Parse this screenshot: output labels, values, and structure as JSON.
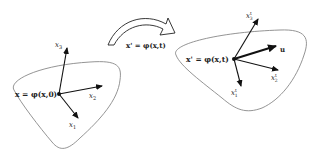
{
  "diagram": {
    "reference_config": {
      "origin_label": "x = φ(x,0)",
      "axes": [
        {
          "name": "x1",
          "label": "x",
          "sub": "1"
        },
        {
          "name": "x2",
          "label": "x",
          "sub": "2"
        },
        {
          "name": "x3",
          "label": "x",
          "sub": "3"
        }
      ]
    },
    "mapping": {
      "label": "x' = φ(x,t)"
    },
    "current_config": {
      "origin_label": "x' = φ(x,t)",
      "axes": [
        {
          "name": "x1_prime",
          "label": "x",
          "sup": "t",
          "sub": "1"
        },
        {
          "name": "x2_prime",
          "label": "x",
          "sup": "t",
          "sub": "2"
        },
        {
          "name": "x3_prime",
          "label": "x",
          "sup": "t",
          "sub": "3"
        }
      ],
      "vector": {
        "name": "u",
        "label": "u"
      }
    },
    "colors": {
      "outline": "#888888",
      "arrow": "#111111",
      "text": "#222222"
    }
  }
}
